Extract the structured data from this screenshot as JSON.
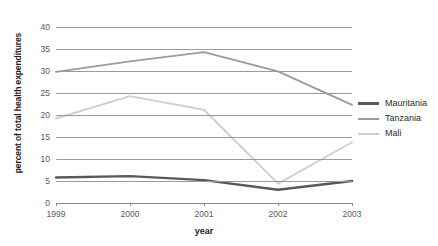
{
  "chart_data": {
    "type": "line",
    "title": "",
    "xlabel": "year",
    "ylabel": "percent of total health expenditures",
    "categories": [
      "1999",
      "2000",
      "2001",
      "2002",
      "2003"
    ],
    "x": [
      1999,
      2000,
      2001,
      2002,
      2003
    ],
    "ylim": [
      0,
      40
    ],
    "yticks": [
      0,
      5,
      10,
      15,
      20,
      25,
      30,
      35,
      40
    ],
    "ytick_labels": [
      "0",
      "5",
      "10",
      "15",
      "20",
      "25",
      "30",
      "35",
      "40"
    ],
    "grid": true,
    "legend_position": "right",
    "series": [
      {
        "name": "Mauritania",
        "color": "#595959",
        "values": [
          5.8,
          6.1,
          5.2,
          3.0,
          5.0
        ]
      },
      {
        "name": "Tanzania",
        "color": "#9b9b9b",
        "values": [
          29.8,
          32.2,
          34.3,
          29.9,
          22.3
        ]
      },
      {
        "name": "Mali",
        "color": "#cfcfcf",
        "values": [
          19.2,
          24.3,
          21.2,
          4.4,
          13.8
        ]
      }
    ]
  },
  "axis": {
    "y_title": "percent of total health expenditures",
    "x_title": "year",
    "y_labels": [
      "40",
      "35",
      "30",
      "25",
      "20",
      "15",
      "10",
      "5",
      "0"
    ],
    "x_labels": [
      "1999",
      "2000",
      "2001",
      "2002",
      "2003"
    ]
  },
  "legend": {
    "items": [
      {
        "label": "Mauritania",
        "color": "#595959"
      },
      {
        "label": "Tanzania",
        "color": "#9b9b9b"
      },
      {
        "label": "Mali",
        "color": "#cfcfcf"
      }
    ]
  },
  "colors": {
    "background": "#ffffff",
    "gridline": "#9a9a9a",
    "tick_text": "#5a5a5a",
    "title_text": "#1d1d1d"
  }
}
